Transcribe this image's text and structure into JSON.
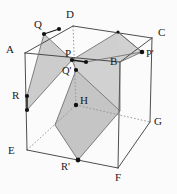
{
  "figure": {
    "type": "geometry-diagram",
    "background_color": "#fbfbfb",
    "stroke_color": "#3a3a3a",
    "hidden_stroke_color": "#8d8d8d",
    "shade_fill": "#c9c9c9",
    "shade_stroke": "#777777",
    "point_color": "#111111"
  },
  "labels": [
    {
      "id": "A",
      "text": "A",
      "x": 6,
      "y": 44
    },
    {
      "id": "B",
      "text": "B",
      "x": 110,
      "y": 56
    },
    {
      "id": "C",
      "text": "C",
      "x": 158,
      "y": 27
    },
    {
      "id": "D",
      "text": "D",
      "x": 66,
      "y": 9
    },
    {
      "id": "E",
      "text": "E",
      "x": 8,
      "y": 145
    },
    {
      "id": "F",
      "text": "F",
      "x": 115,
      "y": 172
    },
    {
      "id": "G",
      "text": "G",
      "x": 154,
      "y": 116
    },
    {
      "id": "H",
      "text": "H",
      "x": 80,
      "y": 95
    },
    {
      "id": "P",
      "text": "P",
      "x": 65,
      "y": 48
    },
    {
      "id": "Pp",
      "text": "P'",
      "x": 146,
      "y": 49
    },
    {
      "id": "Q",
      "text": "Q",
      "x": 34,
      "y": 19
    },
    {
      "id": "Qp",
      "text": "Q'",
      "x": 62,
      "y": 66
    },
    {
      "id": "R",
      "text": "R",
      "x": 12,
      "y": 90
    },
    {
      "id": "Rp",
      "text": "R'",
      "x": 61,
      "y": 162
    }
  ],
  "vertices": {
    "A": {
      "x": 25,
      "y": 53
    },
    "B": {
      "x": 120,
      "y": 62
    },
    "C": {
      "x": 152,
      "y": 38
    },
    "D": {
      "x": 73,
      "y": 26
    },
    "E": {
      "x": 27,
      "y": 150
    },
    "F": {
      "x": 118,
      "y": 168
    },
    "G": {
      "x": 150,
      "y": 122
    },
    "H": {
      "x": 76,
      "y": 105
    }
  },
  "marked_points": [
    {
      "id": "Q",
      "x": 44,
      "y": 34
    },
    {
      "id": "Q-mid",
      "x": 59,
      "y": 29
    },
    {
      "id": "P",
      "x": 72,
      "y": 60
    },
    {
      "id": "P-right",
      "x": 86,
      "y": 62
    },
    {
      "id": "Pp",
      "x": 142,
      "y": 52
    },
    {
      "id": "Qp",
      "x": 76,
      "y": 70
    },
    {
      "id": "H",
      "x": 76,
      "y": 105
    },
    {
      "id": "R",
      "x": 27,
      "y": 96
    },
    {
      "id": "R-low",
      "x": 27,
      "y": 110
    },
    {
      "id": "Rp",
      "x": 78,
      "y": 160
    },
    {
      "id": "top-apex",
      "x": 118,
      "y": 32
    }
  ],
  "edges": {
    "solid": [
      {
        "name": "A-D",
        "from": "A",
        "to": "D"
      },
      {
        "name": "A-B",
        "from": "A",
        "to": "B"
      },
      {
        "name": "A-E",
        "from": "A",
        "to": "E"
      },
      {
        "name": "D-C",
        "from": "D",
        "to": "C"
      },
      {
        "name": "B-C",
        "from": "B",
        "to": "C"
      },
      {
        "name": "B-F",
        "from": "B",
        "to": "F"
      },
      {
        "name": "C-G",
        "from": "C",
        "to": "G"
      },
      {
        "name": "E-F",
        "from": "E",
        "to": "F"
      },
      {
        "name": "F-G",
        "from": "F",
        "to": "G"
      }
    ],
    "hidden": [
      {
        "name": "D-H",
        "from": "D",
        "to": "H"
      },
      {
        "name": "E-H",
        "from": "E",
        "to": "H"
      },
      {
        "name": "H-G",
        "from": "H",
        "to": "G"
      }
    ]
  },
  "shaded_regions": [
    {
      "name": "left-cross-section",
      "points": "Q, P, R",
      "path": "44,34 72,60 27,110 27,96"
    },
    {
      "name": "right-cross-section",
      "points": "P, apex, P', B, R', Q'",
      "path": "72,60 118,32 142,52 120,62 120,111 78,160 55,125 76,70"
    }
  ]
}
